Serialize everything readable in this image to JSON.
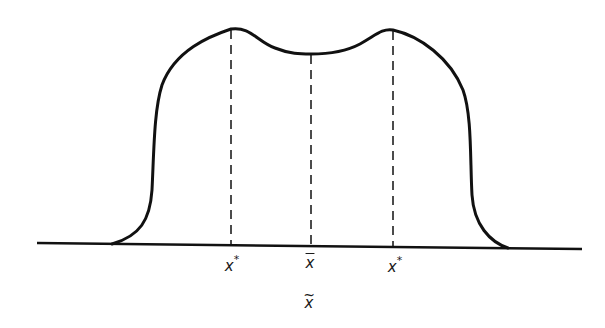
{
  "diagram": {
    "type": "bimodal-distribution-curve",
    "colors": {
      "stroke": "#111111",
      "background": "#ffffff"
    },
    "labels": {
      "left_peak": {
        "base": "x",
        "sup": "*"
      },
      "mean": {
        "base": "x",
        "mark": "bar"
      },
      "right_peak": {
        "base": "x",
        "sup": "*"
      },
      "axis_caption": {
        "base": "x",
        "mark": "~"
      }
    }
  }
}
